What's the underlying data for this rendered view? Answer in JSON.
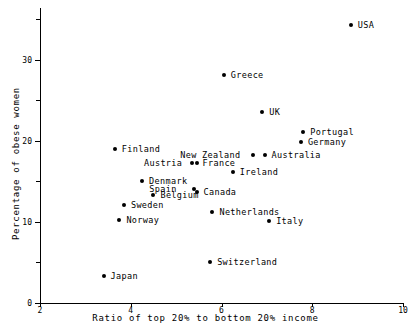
{
  "chart_data": {
    "type": "scatter",
    "title": "",
    "xlabel": "Ratio of top 20% to bottom 20% income",
    "ylabel": "Percentage of obese women",
    "xlim": [
      2,
      10
    ],
    "ylim": [
      0,
      36
    ],
    "grid": false,
    "legend": "none",
    "xticks": [
      2,
      4,
      6,
      8,
      10
    ],
    "xticklabels": [
      "2",
      "4",
      "6",
      "8",
      "10"
    ],
    "yticks_major": [
      0,
      10,
      20,
      30
    ],
    "yticklabels_major": [
      "0",
      "10",
      "20",
      "30"
    ],
    "yticks_minor": [
      5,
      15,
      25,
      35
    ],
    "marker_color": "#000000",
    "points": [
      {
        "label": "USA",
        "x": 8.85,
        "y": 34.3,
        "lx": 7,
        "ly": 0
      },
      {
        "label": "Greece",
        "x": 6.05,
        "y": 28.1,
        "lx": 7,
        "ly": 0
      },
      {
        "label": "UK",
        "x": 6.9,
        "y": 23.6,
        "lx": 7,
        "ly": 0
      },
      {
        "label": "Portugal",
        "x": 7.8,
        "y": 21.1,
        "lx": 7,
        "ly": 0
      },
      {
        "label": "Germany",
        "x": 7.75,
        "y": 19.8,
        "lx": 7,
        "ly": 0
      },
      {
        "label": "Finland",
        "x": 3.65,
        "y": 19.0,
        "lx": 7,
        "ly": 0
      },
      {
        "label": "Australia",
        "x": 6.95,
        "y": 18.2,
        "lx": 7,
        "ly": 0
      },
      {
        "label": "New Zealand",
        "x": 6.7,
        "y": 18.2,
        "lx": -73,
        "ly": 0
      },
      {
        "label": "France",
        "x": 5.45,
        "y": 17.2,
        "lx": 6,
        "ly": 0
      },
      {
        "label": "Austria",
        "x": 5.35,
        "y": 17.2,
        "lx": -48,
        "ly": 0
      },
      {
        "label": "Ireland",
        "x": 6.25,
        "y": 16.1,
        "lx": 7,
        "ly": 0
      },
      {
        "label": "Denmark",
        "x": 4.25,
        "y": 15.0,
        "lx": 7,
        "ly": 0
      },
      {
        "label": "Canada",
        "x": 5.45,
        "y": 13.7,
        "lx": 7,
        "ly": 0
      },
      {
        "label": "Spain",
        "x": 5.4,
        "y": 14.1,
        "lx": -45,
        "ly": 0
      },
      {
        "label": "Belgium",
        "x": 4.5,
        "y": 13.3,
        "lx": 7,
        "ly": 0
      },
      {
        "label": "Sweden",
        "x": 3.85,
        "y": 12.1,
        "lx": 7,
        "ly": 0
      },
      {
        "label": "Netherlands",
        "x": 5.8,
        "y": 11.2,
        "lx": 7,
        "ly": 0
      },
      {
        "label": "Norway",
        "x": 3.75,
        "y": 10.2,
        "lx": 7,
        "ly": 0
      },
      {
        "label": "Italy",
        "x": 7.05,
        "y": 10.1,
        "lx": 7,
        "ly": 0
      },
      {
        "label": "Switzerland",
        "x": 5.75,
        "y": 5.1,
        "lx": 7,
        "ly": 0
      },
      {
        "label": "Japan",
        "x": 3.4,
        "y": 3.3,
        "lx": 7,
        "ly": 0
      }
    ]
  }
}
